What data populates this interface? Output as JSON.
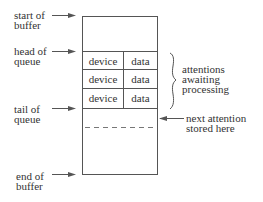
{
  "diagram": {
    "type": "buffer-queue",
    "colors": {
      "line": "#555555",
      "text": "#333333",
      "background": "#ffffff"
    },
    "left_labels": [
      {
        "line1": "start of",
        "line2": "buffer"
      },
      {
        "line1": "head of",
        "line2": "queue"
      },
      {
        "line1": "tail of",
        "line2": "queue"
      },
      {
        "line1": "end of",
        "line2": "buffer"
      }
    ],
    "queue_rows": [
      {
        "col1": "device",
        "col2": "data"
      },
      {
        "col1": "device",
        "col2": "data"
      },
      {
        "col1": "device",
        "col2": "data"
      }
    ],
    "brace_label": {
      "line1": "attentions",
      "line2": "awaiting",
      "line3": "processing"
    },
    "next_label": {
      "line1": "next attention",
      "line2": "stored here"
    }
  }
}
